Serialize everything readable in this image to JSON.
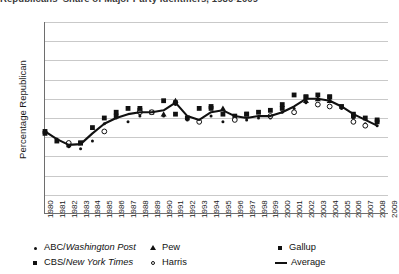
{
  "title_sliver": "Republicans' Share of Major Party Identifiers, 1980-2009",
  "chart_data": {
    "type": "scatter",
    "title": "",
    "xlabel": "",
    "ylabel": "Percentage Republican",
    "xlim": [
      1980,
      2009
    ],
    "ylim": [
      20,
      70
    ],
    "yticks": [
      70,
      65,
      60,
      55,
      50,
      45,
      40,
      35,
      30,
      25,
      20
    ],
    "xticks": [
      1980,
      1981,
      1982,
      1983,
      1984,
      1985,
      1986,
      1987,
      1988,
      1989,
      1990,
      1991,
      1992,
      1993,
      1994,
      1995,
      1996,
      1997,
      1998,
      1999,
      2000,
      2001,
      2002,
      2003,
      2004,
      2005,
      2006,
      2007,
      2008,
      2009
    ],
    "grid": true,
    "legend_position": "bottom",
    "series": [
      {
        "name": "ABC/Washington Post",
        "marker": "small-dot",
        "x": [
          1981,
          1982,
          1983,
          1984,
          1985,
          1986,
          1987,
          1988,
          1989,
          1990,
          1991,
          1992,
          1993,
          1994,
          1995,
          1996,
          1997,
          1998,
          1999,
          2000,
          2001,
          2002,
          2003,
          2004,
          2005,
          2006,
          2007,
          2008
        ],
        "values": [
          39.5,
          37.5,
          37.0,
          39.0,
          43.5,
          45.0,
          44.0,
          45.5,
          46.5,
          45.5,
          48.5,
          44.5,
          44.0,
          45.5,
          44.0,
          44.5,
          44.5,
          45.0,
          45.0,
          46.5,
          47.5,
          49.0,
          48.5,
          49.5,
          47.5,
          45.0,
          43.5,
          43.0
        ]
      },
      {
        "name": "CBS/New York Times",
        "marker": "square",
        "x": [
          1980,
          1981,
          1982,
          1983,
          1984,
          1985,
          1986,
          1987,
          1988,
          1989,
          1990,
          1991,
          1992,
          1993,
          1994,
          1995,
          1996,
          1997,
          1998,
          1999,
          2000,
          2001,
          2002,
          2003,
          2004,
          2005,
          2006,
          2007,
          2008
        ],
        "values": [
          41.5,
          39.0,
          38.0,
          38.5,
          42.5,
          45.0,
          46.5,
          47.5,
          47.0,
          46.5,
          49.5,
          46.0,
          45.0,
          47.5,
          48.0,
          46.0,
          45.5,
          46.0,
          46.5,
          47.0,
          48.5,
          51.0,
          50.5,
          51.0,
          50.5,
          48.0,
          45.5,
          45.0,
          44.5
        ]
      },
      {
        "name": "Pew",
        "marker": "triangle",
        "x": [
          1990,
          1991,
          1995,
          2002,
          2003,
          2004
        ],
        "values": [
          46.0,
          49.5,
          47.5,
          49.5,
          50.0,
          49.5
        ]
      },
      {
        "name": "Harris",
        "marker": "open-circle",
        "x": [
          1982,
          1985,
          1988,
          1989,
          1993,
          1996,
          1999,
          2001,
          2003,
          2004,
          2006,
          2007
        ],
        "values": [
          38.5,
          41.5,
          46.5,
          46.5,
          44.0,
          44.5,
          45.5,
          46.5,
          48.5,
          48.0,
          44.0,
          43.0
        ]
      },
      {
        "name": "Gallup",
        "marker": "filled-square",
        "x": [
          1980,
          1983,
          1986,
          1988,
          1991,
          1994,
          1997,
          2000,
          2002,
          2004,
          2006,
          2008
        ],
        "values": [
          41.0,
          38.5,
          45.5,
          47.5,
          49.0,
          47.5,
          46.0,
          47.5,
          50.5,
          50.5,
          46.0,
          44.0
        ]
      },
      {
        "name": "Average",
        "marker": "line",
        "x": [
          1980,
          1981,
          1982,
          1983,
          1984,
          1985,
          1986,
          1987,
          1988,
          1989,
          1990,
          1991,
          1992,
          1993,
          1994,
          1995,
          1996,
          1997,
          1998,
          1999,
          2000,
          2001,
          2002,
          2003,
          2004,
          2005,
          2006,
          2007,
          2008
        ],
        "values": [
          41.5,
          39.5,
          38.0,
          38.2,
          41.0,
          43.5,
          45.0,
          46.0,
          46.5,
          46.5,
          47.0,
          49.0,
          45.5,
          44.5,
          46.5,
          47.0,
          45.5,
          45.0,
          45.5,
          45.5,
          46.5,
          48.0,
          50.0,
          50.0,
          49.5,
          48.0,
          46.0,
          44.5,
          43.0
        ]
      }
    ]
  },
  "legend": [
    {
      "label_plain": "ABC/",
      "label_italic": "Washington Post",
      "marker": "small-dot"
    },
    {
      "label_plain": "CBS/",
      "label_italic": "New York Times",
      "marker": "square"
    },
    {
      "label_plain": "Pew",
      "label_italic": "",
      "marker": "triangle"
    },
    {
      "label_plain": "Harris",
      "label_italic": "",
      "marker": "open-circle"
    },
    {
      "label_plain": "Gallup",
      "label_italic": "",
      "marker": "filled-square"
    },
    {
      "label_plain": "Average",
      "label_italic": "",
      "marker": "line"
    }
  ],
  "colors": {
    "ink": "#111111",
    "grid": "#c9c9c9",
    "axis": "#6e6e6e",
    "background": "#ffffff"
  }
}
